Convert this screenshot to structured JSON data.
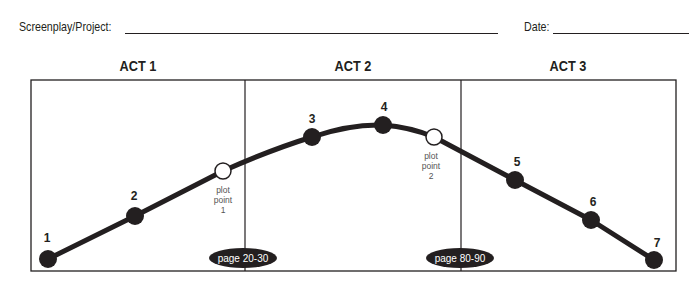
{
  "header": {
    "project_label": "Screenplay/Project:",
    "project_value": "",
    "date_label": "Date:",
    "date_value": ""
  },
  "acts": [
    {
      "label": "ACT 1"
    },
    {
      "label": "ACT 2"
    },
    {
      "label": "ACT 3"
    }
  ],
  "points": [
    {
      "label": "1",
      "type": "beat"
    },
    {
      "label": "2",
      "type": "beat"
    },
    {
      "label": "plot point 1",
      "type": "plot-point"
    },
    {
      "label": "3",
      "type": "beat"
    },
    {
      "label": "4",
      "type": "beat"
    },
    {
      "label": "plot point 2",
      "type": "plot-point"
    },
    {
      "label": "5",
      "type": "beat"
    },
    {
      "label": "6",
      "type": "beat"
    },
    {
      "label": "7",
      "type": "beat"
    }
  ],
  "plot_point_1": {
    "line1": "plot",
    "line2": "point",
    "line3": "1"
  },
  "plot_point_2": {
    "line1": "plot",
    "line2": "point",
    "line3": "2"
  },
  "page_markers": [
    {
      "label": "page 20-30"
    },
    {
      "label": "page 80-90"
    }
  ],
  "colors": {
    "ink": "#231f20",
    "paper": "#ffffff",
    "plot_point_fill": "#ffffff"
  }
}
